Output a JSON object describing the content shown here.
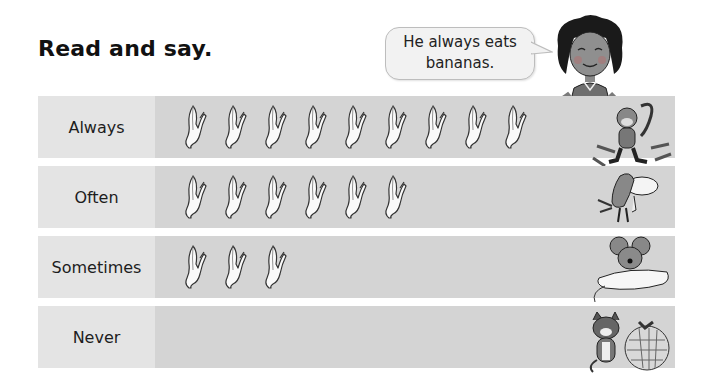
{
  "title": "Read and say.",
  "speech_bubble": {
    "line1": "He always eats",
    "line2": "bananas."
  },
  "rows": [
    {
      "label": "Always",
      "banana_count": 9,
      "animal": "monkey"
    },
    {
      "label": "Often",
      "banana_count": 6,
      "animal": "bird"
    },
    {
      "label": "Sometimes",
      "banana_count": 3,
      "animal": "mouse"
    },
    {
      "label": "Never",
      "banana_count": 0,
      "animal": "cat"
    }
  ],
  "colors": {
    "label_cell": "#e4e4e4",
    "track_cell": "#d4d4d4",
    "bubble_fill": "#f2f2f2"
  }
}
